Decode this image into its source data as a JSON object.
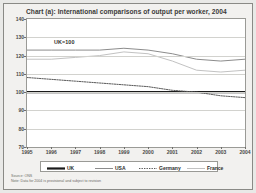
{
  "figure": {
    "title": "Chart (a): International comparisons of output per worker, 2004",
    "index_note": "UK=100",
    "source": "Source: ONS",
    "note": "Note: Data for 2004 is provisional and subject to revision"
  },
  "legend": {
    "items": [
      {
        "label": "UK",
        "style": "solid-thick",
        "color": "#1a1a1a"
      },
      {
        "label": "USA",
        "style": "solid",
        "color": "#8c8c8c"
      },
      {
        "label": "Germany",
        "style": "dotted",
        "color": "#5a5a5a"
      },
      {
        "label": "France",
        "style": "solid-light",
        "color": "#c2c2c2"
      }
    ]
  },
  "chart_data": {
    "type": "line",
    "title": "Chart (a): International comparisons of output per worker, 2004",
    "xlabel": "",
    "ylabel": "",
    "ylim": [
      70,
      140
    ],
    "yticks": [
      70,
      80,
      90,
      100,
      110,
      120,
      130,
      140
    ],
    "grid": true,
    "legend_position": "bottom",
    "annotation": "UK=100",
    "x": [
      1995,
      1996,
      1997,
      1998,
      1999,
      2000,
      2001,
      2002,
      2003,
      2004
    ],
    "categories": [
      "1995",
      "1996",
      "1997",
      "1998",
      "1999",
      "2000",
      "2001",
      "2002",
      "2003",
      "2004"
    ],
    "series": [
      {
        "name": "UK",
        "color": "#1a1a1a",
        "style": "solid-thick",
        "values": [
          100,
          100,
          100,
          100,
          100,
          100,
          100,
          100,
          100,
          100
        ]
      },
      {
        "name": "USA",
        "color": "#8c8c8c",
        "style": "solid",
        "values": [
          123,
          123,
          123,
          123,
          124,
          123,
          121,
          118,
          117,
          118
        ]
      },
      {
        "name": "Germany",
        "color": "#5a5a5a",
        "style": "dotted",
        "values": [
          108,
          107,
          106,
          105,
          104,
          103,
          101,
          100,
          98,
          97
        ]
      },
      {
        "name": "France",
        "color": "#c2c2c2",
        "style": "solid-light",
        "values": [
          118,
          118,
          119,
          120,
          122,
          121,
          117,
          112,
          111,
          112
        ]
      }
    ]
  }
}
